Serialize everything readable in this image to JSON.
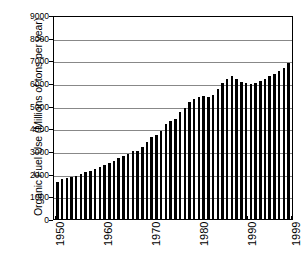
{
  "chart_data": {
    "type": "bar",
    "title": "",
    "xlabel": "",
    "ylabel": "Organic Fuel Use (Millions of tons per year)",
    "ylim": [
      0,
      9000
    ],
    "ytick_labels": [
      "9000",
      "8000",
      "7000",
      "6000",
      "5000",
      "4000",
      "3000",
      "2000",
      "1000",
      "0"
    ],
    "ytick_values": [
      9000,
      8000,
      7000,
      6000,
      5000,
      4000,
      3000,
      2000,
      1000,
      0
    ],
    "xtick_labels": [
      "1950",
      "1960",
      "1970",
      "1980",
      "1990",
      "1999"
    ],
    "xtick_values": [
      1950,
      1960,
      1970,
      1980,
      1990,
      1999
    ],
    "grid": true,
    "legend": null,
    "bar_color": "#000000",
    "grid_color": "#888888",
    "axis_color": "#000000",
    "background_color": "#ffffff",
    "categories": [
      1950,
      1951,
      1952,
      1953,
      1954,
      1955,
      1956,
      1957,
      1958,
      1959,
      1960,
      1961,
      1962,
      1963,
      1964,
      1965,
      1966,
      1967,
      1968,
      1969,
      1970,
      1971,
      1972,
      1973,
      1974,
      1975,
      1976,
      1977,
      1978,
      1979,
      1980,
      1981,
      1982,
      1983,
      1984,
      1985,
      1986,
      1987,
      1988,
      1989,
      1990,
      1991,
      1992,
      1993,
      1994,
      1995,
      1996,
      1997,
      1998,
      1999
    ],
    "values": [
      1620,
      1780,
      1800,
      1860,
      1880,
      2000,
      2080,
      2140,
      2200,
      2300,
      2400,
      2450,
      2560,
      2680,
      2800,
      2880,
      2980,
      3020,
      3180,
      3400,
      3600,
      3720,
      3900,
      4180,
      4320,
      4420,
      4700,
      4880,
      5180,
      5280,
      5400,
      5440,
      5400,
      5460,
      5720,
      6020,
      6160,
      6300,
      6160,
      6040,
      6020,
      5940,
      5980,
      6080,
      6180,
      6300,
      6400,
      6520,
      6680,
      6900
    ],
    "values_note": "bar heights in millions of tons per year"
  }
}
